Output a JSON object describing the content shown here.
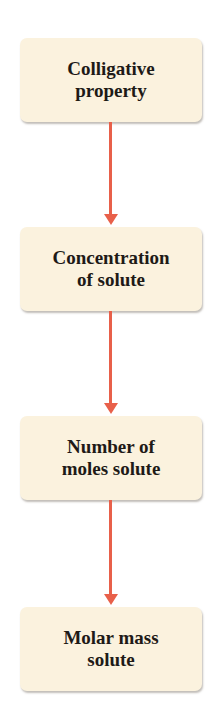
{
  "diagram": {
    "type": "flowchart",
    "direction": "top-to-bottom",
    "arrow_color": "#e8604a",
    "box_color": "#fbf2de",
    "nodes": [
      {
        "id": "n1",
        "label": "Colligative\nproperty"
      },
      {
        "id": "n2",
        "label": "Concentration\nof solute"
      },
      {
        "id": "n3",
        "label": "Number of\nmoles solute"
      },
      {
        "id": "n4",
        "label": "Molar mass\nsolute"
      }
    ],
    "edges": [
      {
        "from": "n1",
        "to": "n2"
      },
      {
        "from": "n2",
        "to": "n3"
      },
      {
        "from": "n3",
        "to": "n4"
      }
    ]
  }
}
